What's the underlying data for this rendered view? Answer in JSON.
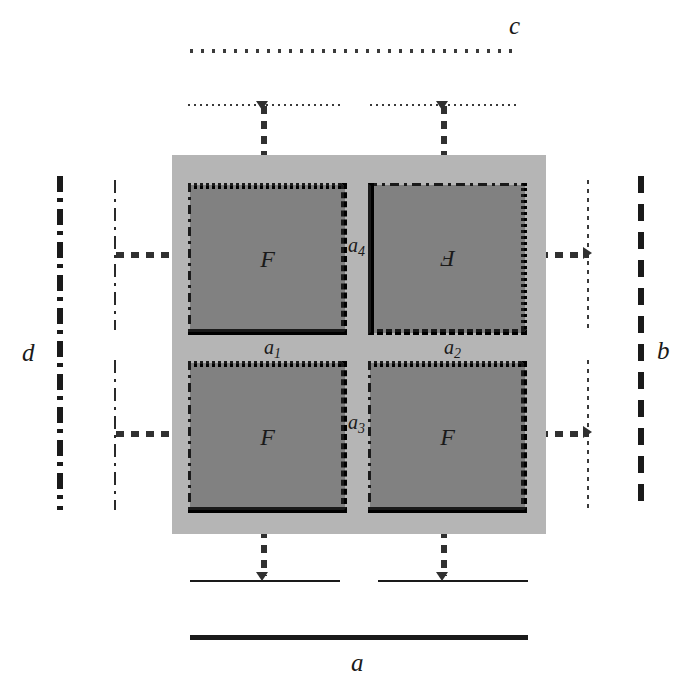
{
  "figure": {
    "title": "",
    "background_color": "#ffffff",
    "panel_color": "#b5b5b5",
    "square_color": "#818181",
    "ink_color": "#1a1a1a"
  },
  "outer_labels": {
    "top": "c",
    "bottom": "a",
    "left": "d",
    "right": "b"
  },
  "inner_labels": {
    "a1": "a",
    "a1_sub": "1",
    "a2": "a",
    "a2_sub": "2",
    "a3": "a",
    "a3_sub": "3",
    "a4": "a",
    "a4_sub": "4"
  },
  "squares": [
    {
      "id": "top-left",
      "letter": "F",
      "rotated": false,
      "edges": {
        "top": "dotted",
        "right": "dashed",
        "bottom": "solid",
        "left": "dashdot"
      }
    },
    {
      "id": "top-right",
      "letter": "F",
      "rotated": true,
      "edges": {
        "top": "dashdot",
        "right": "dotted",
        "bottom": "dashed",
        "left": "solid"
      }
    },
    {
      "id": "bottom-left",
      "letter": "F",
      "rotated": false,
      "edges": {
        "top": "dotted",
        "right": "dashed",
        "bottom": "solid",
        "left": "dashdot"
      }
    },
    {
      "id": "bottom-right",
      "letter": "F",
      "rotated": false,
      "edges": {
        "top": "dotted",
        "right": "dashed",
        "bottom": "solid",
        "left": "dashdot"
      }
    }
  ],
  "boundary_lines": {
    "top_c_line": "dotted-med",
    "top_inner_lines": "dotted-thin",
    "bottom_a_line": "solid-thick",
    "bottom_inner_lines": "solid-thin",
    "left_d_line": "dashdot-thick",
    "left_inner_line": "dashdot-thin",
    "right_b_line": "dashed-thick",
    "right_inner_line": "dotted-thin"
  }
}
